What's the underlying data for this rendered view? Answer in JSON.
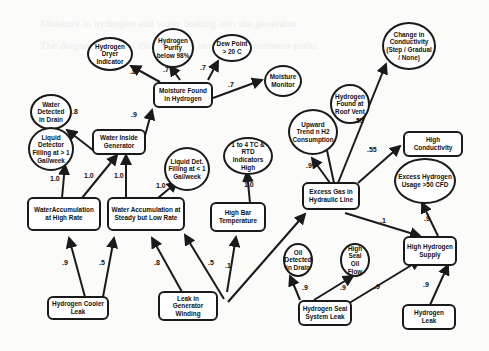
{
  "diagram": {
    "type": "causal-network",
    "nodes": {
      "h2_dryer": "Hydrogen Dryer Indicator",
      "h2_purity": "Hydrogen Purity below 98%",
      "dew_point": "Dew Point > 20 C",
      "change_cond": "Change in Conductivity (Step / Gradual / None)",
      "water_drain": "Water Detected in Drain",
      "moisture_found": "Moisture Found in Hydrogen",
      "moisture_monitor": "Moisture Monitor",
      "h2_roof": "Hydrogen Found at Roof Vent",
      "liquid_gt1": "Liquid Detector Filling at > 1 Gal/week",
      "water_inside": "Water Inside Generator",
      "upward_trend": "Upward Trend n H2 Consumption",
      "high_cond": "High Conductivity",
      "liquid_lt1": "Liquid Det. Filling at < 1 Gal/week",
      "tc_rtd": "1 to 4 TC & RTD Indicators High",
      "excess_gas": "Excess Gas in Hydraulic Line",
      "excess_h2": "Excess Hydrogen Usage >50 CFD",
      "water_high": "WaterAccumulation at High Rate",
      "water_low": "Water Accumulation at Steady but Low Rate",
      "high_bar": "High Bar Temperature",
      "oil_drain": "Oil Detected in Drain",
      "high_seal_oil": "High Seal Oil Flow",
      "high_h2_supply": "High Hydrogen Supply",
      "h2_cooler": "Hydrogen Cooler Leak",
      "leak_winding": "Leak in Generator Winding",
      "h2_seal_leak": "Hydrogen Seal System Leak",
      "h2_leak": "Hydrogen Leak"
    },
    "edge_labels": {
      "moisture_dryer": ".8",
      "moisture_purity": ".7",
      "moisture_dew": ".7",
      "moisture_monitor": ".7",
      "water_inside_drain": ".8",
      "water_inside_moisture": ".9",
      "high_liquid": "1.0",
      "high_inside": "1.0",
      "low_inside": "1.0",
      "low_liquid": "1.0",
      "bar_tc": "1.0",
      "gas_trend": ".9",
      "gas_roof": ".55",
      "gas_cond": ".55",
      "gas_supply": ".1",
      "supply_excess": ".9",
      "cooler_high": ".9",
      "cooler_low": ".5",
      "winding_low": ".8",
      "winding_bar": ".5",
      "winding_gas": ".1",
      "seal_oil": ".9",
      "seal_flow": ".9",
      "seal_supply": ".9",
      "leak_supply": ".9"
    }
  }
}
